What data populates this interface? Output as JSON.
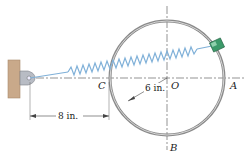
{
  "diagram": {
    "labels": {
      "C": "C",
      "O": "O",
      "A": "A",
      "B": "B"
    },
    "dimensions": {
      "radius": "6 in.",
      "wall_to_C": "8 in."
    },
    "colors": {
      "wall": "#c9a98a",
      "ring": "#8a8a8a",
      "spring": "#7fb0d8",
      "collar": "#3c9a6a",
      "lines": "#555555"
    }
  }
}
